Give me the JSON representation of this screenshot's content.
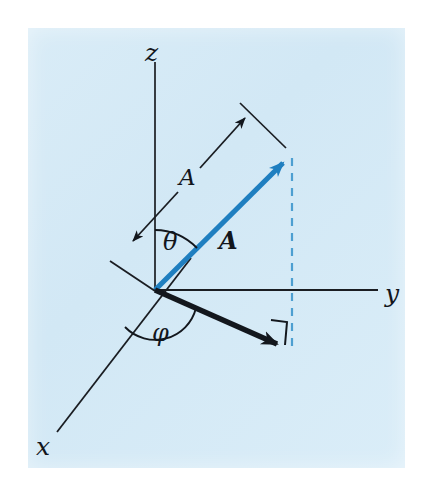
{
  "figure": {
    "background_color": "#d6eaf6",
    "page_color": "#ffffff",
    "vector_color": "#1f7fc0",
    "line_color": "#1a1d22",
    "dashed_color": "#4d9fd1"
  },
  "axes": [
    {
      "name": "z-axis",
      "label": "z",
      "direction": "up"
    },
    {
      "name": "y-axis",
      "label": "y",
      "direction": "right"
    },
    {
      "name": "x-axis",
      "label": "x",
      "direction": "lower-left"
    }
  ],
  "labels": {
    "z": "z",
    "y": "y",
    "x": "x",
    "magnitude": "A",
    "vector": "A",
    "theta": "θ",
    "phi": "φ"
  },
  "annotations": [
    {
      "name": "vector-A",
      "text": "A",
      "style": "bold-italic",
      "meaning": "position vector from origin"
    },
    {
      "name": "magnitude-A",
      "text": "A",
      "style": "italic",
      "meaning": "length of vector A, double-headed measure arrow"
    },
    {
      "name": "polar-angle",
      "text": "θ",
      "meaning": "angle between z-axis and vector A"
    },
    {
      "name": "azimuthal-angle",
      "text": "φ",
      "meaning": "angle in xy-plane from x-axis to projection of A"
    }
  ],
  "geometry": {
    "origin": [
      155,
      290
    ],
    "z_axis_top": [
      155,
      62
    ],
    "y_axis_right": [
      378,
      290
    ],
    "x_axis_end": [
      57,
      432
    ],
    "vector_tip": [
      290,
      156
    ],
    "projection_tip": [
      286,
      351
    ],
    "dashed_top": [
      292,
      158
    ],
    "dashed_bottom": [
      292,
      350
    ]
  }
}
